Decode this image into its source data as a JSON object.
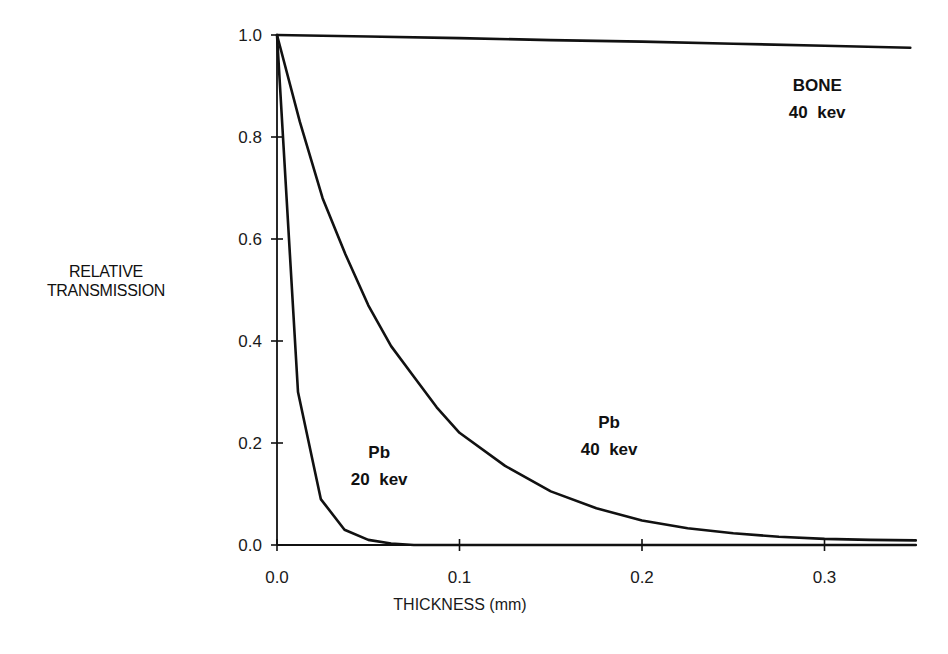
{
  "chart_data": {
    "type": "line",
    "title": "",
    "xlabel": "THICKNESS (mm)",
    "ylabel": "RELATIVE TRANSMISSION",
    "ylabel_lines": [
      "RELATIVE",
      "TRANSMISSION"
    ],
    "xlim": [
      0.0,
      0.35
    ],
    "ylim": [
      0.0,
      1.0
    ],
    "x_ticks": [
      0.0,
      0.1,
      0.2,
      0.3
    ],
    "x_tick_labels": [
      "0.0",
      "0.1",
      "0.2",
      "0.3"
    ],
    "y_ticks": [
      0.0,
      0.2,
      0.4,
      0.6,
      0.8,
      1.0
    ],
    "y_tick_labels": [
      "0.0",
      "0.2",
      "0.4",
      "0.6",
      "0.8",
      "1.0"
    ],
    "grid": false,
    "legend": "none (curves labeled inline)",
    "series": [
      {
        "name": "BONE 40 kev",
        "label_lines": [
          "BONE",
          "40 kev"
        ],
        "label_pos": [
          0.296,
          0.89
        ],
        "x": [
          0.0,
          0.05,
          0.1,
          0.15,
          0.2,
          0.25,
          0.3,
          0.347
        ],
        "y": [
          1.0,
          0.997,
          0.994,
          0.99,
          0.987,
          0.983,
          0.979,
          0.975
        ]
      },
      {
        "name": "Pb 40 kev",
        "label_lines": [
          "Pb",
          "40 kev"
        ],
        "label_pos": [
          0.182,
          0.23
        ],
        "x": [
          0.0,
          0.0125,
          0.025,
          0.0375,
          0.05,
          0.0625,
          0.075,
          0.0875,
          0.1,
          0.125,
          0.15,
          0.175,
          0.2,
          0.225,
          0.25,
          0.275,
          0.3,
          0.325,
          0.35
        ],
        "y": [
          1.0,
          0.83,
          0.68,
          0.57,
          0.47,
          0.39,
          0.33,
          0.27,
          0.22,
          0.155,
          0.105,
          0.072,
          0.048,
          0.033,
          0.023,
          0.016,
          0.012,
          0.01,
          0.009
        ]
      },
      {
        "name": "Pb 20 kev",
        "label_lines": [
          "Pb",
          "20 kev"
        ],
        "label_pos": [
          0.056,
          0.17
        ],
        "x": [
          0.0,
          0.0115,
          0.024,
          0.037,
          0.05,
          0.0625,
          0.075,
          0.1,
          0.2,
          0.3,
          0.35
        ],
        "y": [
          1.0,
          0.3,
          0.09,
          0.03,
          0.01,
          0.003,
          0.0,
          0.0,
          0.0,
          0.0,
          0.0
        ]
      }
    ]
  }
}
